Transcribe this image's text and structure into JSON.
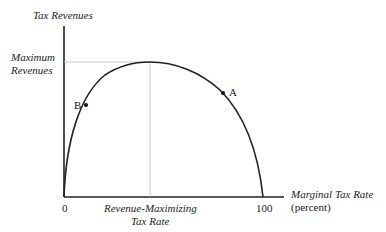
{
  "diagram": {
    "type": "laffer-curve",
    "y_axis_label": "Tax Revenues",
    "max_label_line1": "Maximum",
    "max_label_line2": "Revenues",
    "x_axis_label_line1": "Marginal Tax Rate",
    "x_axis_label_line2": "(percent)",
    "x_tick_zero": "0",
    "x_tick_hundred": "100",
    "rev_max_line1": "Revenue-Maximizing",
    "rev_max_line2": "Tax Rate",
    "point_a": "A",
    "point_b": "B"
  }
}
